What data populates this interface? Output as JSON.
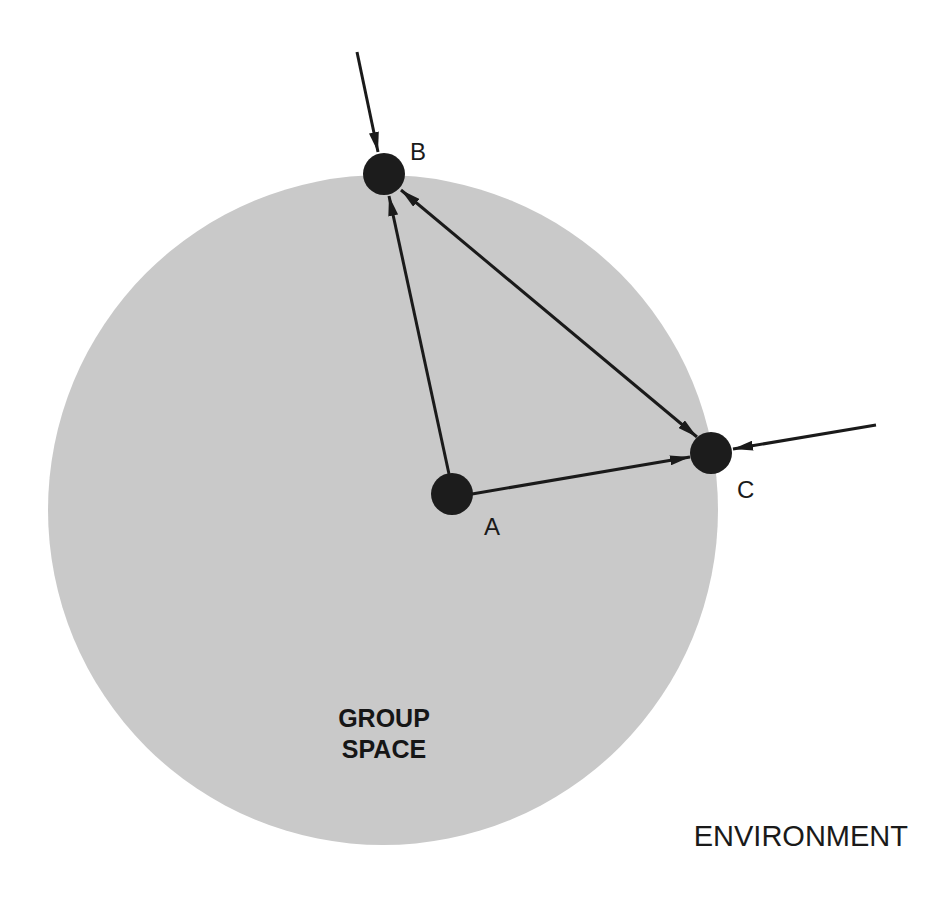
{
  "diagram": {
    "colors": {
      "background": "#ffffff",
      "group_space_fill": "#c9c9c9",
      "node_fill": "#1c1c1c",
      "line": "#1a1a1a"
    },
    "group_space": {
      "label_line1": "GROUP",
      "label_line2": "SPACE"
    },
    "environment": {
      "label": "ENVIRONMENT"
    },
    "nodes": [
      {
        "id": "A",
        "label": "A"
      },
      {
        "id": "B",
        "label": "B"
      },
      {
        "id": "C",
        "label": "C"
      }
    ],
    "edges": [
      {
        "from": "A",
        "to": "B",
        "direction": "A→B"
      },
      {
        "from": "A",
        "to": "C",
        "direction": "A→C"
      },
      {
        "from": "B",
        "to": "C",
        "direction": "B↔C"
      },
      {
        "from": "environment",
        "to": "B",
        "direction": "external→B"
      },
      {
        "from": "environment",
        "to": "C",
        "direction": "external→C"
      }
    ]
  }
}
